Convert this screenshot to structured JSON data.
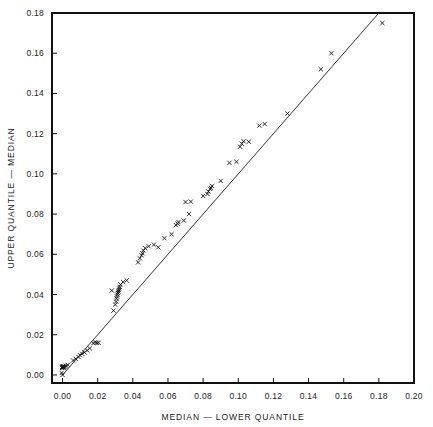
{
  "chart_data": {
    "type": "scatter",
    "title": "",
    "xlabel": "MEDIAN — LOWER QUANTILE",
    "ylabel": "UPPER QUANTILE — MEDIAN",
    "xlim": [
      -0.006,
      0.2
    ],
    "ylim": [
      -0.004,
      0.18
    ],
    "xticks": [
      0.0,
      0.02,
      0.04,
      0.06,
      0.08,
      0.1,
      0.12,
      0.14,
      0.16,
      0.18,
      0.2
    ],
    "xticklabels": [
      "0.00",
      "0.02",
      "0.04",
      "0.06",
      "0.08",
      "0.10",
      "0.12",
      "0.14",
      "0.16",
      "0.18",
      "0.20"
    ],
    "yticks": [
      0.0,
      0.02,
      0.04,
      0.06,
      0.08,
      0.1,
      0.12,
      0.14,
      0.16,
      0.18
    ],
    "yticklabels": [
      "0.00",
      "0.02",
      "0.04",
      "0.06",
      "0.08",
      "0.10",
      "0.12",
      "0.14",
      "0.16",
      "0.18"
    ],
    "grid": false,
    "legend": false,
    "marker": "x",
    "marker_color": "#111111",
    "reference_line": {
      "label": "y = x",
      "x0": 0.0,
      "y0": 0.0,
      "x1": 0.18,
      "y1": 0.18,
      "color": "#333333"
    },
    "points": [
      [
        0.0,
        0.0
      ],
      [
        -0.0005,
        0.001
      ],
      [
        -0.0003,
        0.0035
      ],
      [
        -0.0002,
        0.004
      ],
      [
        0.0,
        0.0042
      ],
      [
        0.0002,
        0.0038
      ],
      [
        0.0004,
        0.0044
      ],
      [
        0.0006,
        0.0036
      ],
      [
        0.001,
        0.004
      ],
      [
        0.0014,
        0.0042
      ],
      [
        0.002,
        0.0046
      ],
      [
        0.003,
        0.005
      ],
      [
        0.006,
        0.0072
      ],
      [
        0.0075,
        0.008
      ],
      [
        0.009,
        0.009
      ],
      [
        0.01,
        0.0098
      ],
      [
        0.0112,
        0.0105
      ],
      [
        0.0125,
        0.0112
      ],
      [
        0.014,
        0.0122
      ],
      [
        0.0155,
        0.0132
      ],
      [
        0.0175,
        0.0158
      ],
      [
        0.0185,
        0.0162
      ],
      [
        0.0195,
        0.016
      ],
      [
        0.0205,
        0.016
      ],
      [
        0.029,
        0.032
      ],
      [
        0.03,
        0.035
      ],
      [
        0.0305,
        0.0365
      ],
      [
        0.0308,
        0.038
      ],
      [
        0.031,
        0.039
      ],
      [
        0.0312,
        0.04
      ],
      [
        0.0315,
        0.0408
      ],
      [
        0.0318,
        0.0415
      ],
      [
        0.032,
        0.0422
      ],
      [
        0.0322,
        0.043
      ],
      [
        0.0325,
        0.0438
      ],
      [
        0.033,
        0.045
      ],
      [
        0.0345,
        0.0462
      ],
      [
        0.0365,
        0.047
      ],
      [
        0.028,
        0.042
      ],
      [
        0.043,
        0.056
      ],
      [
        0.044,
        0.058
      ],
      [
        0.045,
        0.0595
      ],
      [
        0.0455,
        0.0605
      ],
      [
        0.046,
        0.0618
      ],
      [
        0.047,
        0.063
      ],
      [
        0.049,
        0.064
      ],
      [
        0.052,
        0.0648
      ],
      [
        0.0545,
        0.0635
      ],
      [
        0.058,
        0.068
      ],
      [
        0.062,
        0.07
      ],
      [
        0.0645,
        0.0745
      ],
      [
        0.0655,
        0.0752
      ],
      [
        0.066,
        0.076
      ],
      [
        0.069,
        0.0768
      ],
      [
        0.072,
        0.08
      ],
      [
        0.07,
        0.086
      ],
      [
        0.073,
        0.0862
      ],
      [
        0.08,
        0.089
      ],
      [
        0.0825,
        0.09
      ],
      [
        0.083,
        0.0912
      ],
      [
        0.084,
        0.0925
      ],
      [
        0.0845,
        0.093
      ],
      [
        0.085,
        0.094
      ],
      [
        0.09,
        0.0965
      ],
      [
        0.095,
        0.1055
      ],
      [
        0.099,
        0.106
      ],
      [
        0.101,
        0.1135
      ],
      [
        0.102,
        0.115
      ],
      [
        0.103,
        0.1162
      ],
      [
        0.106,
        0.116
      ],
      [
        0.112,
        0.124
      ],
      [
        0.115,
        0.1248
      ],
      [
        0.128,
        0.13
      ],
      [
        0.147,
        0.152
      ],
      [
        0.153,
        0.16
      ],
      [
        0.182,
        0.175
      ]
    ]
  }
}
